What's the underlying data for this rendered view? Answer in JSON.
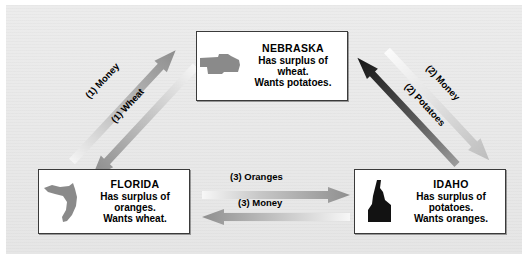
{
  "diagram": {
    "background_color": "#ececec",
    "panel_border_color": "#ffffff"
  },
  "states": [
    {
      "id": "nebraska",
      "name": "NEBRASKA",
      "surplus_line": "Has surplus of",
      "surplus_item": "wheat.",
      "wants_line": "Wants potatoes.",
      "shape_icon": "nebraska-map-icon",
      "shape_color": "#8a8a8a"
    },
    {
      "id": "florida",
      "name": "FLORIDA",
      "surplus_line": "Has surplus of",
      "surplus_item": "oranges.",
      "wants_line": "Wants wheat.",
      "shape_icon": "florida-map-icon",
      "shape_color": "#8a8a8a"
    },
    {
      "id": "idaho",
      "name": "IDAHO",
      "surplus_line": "Has surplus of",
      "surplus_item": "potatoes.",
      "wants_line": "Wants oranges.",
      "shape_icon": "idaho-map-icon",
      "shape_color": "#121212"
    }
  ],
  "flows": [
    {
      "id": "money1",
      "label": "(1) Money",
      "from": "FLORIDA",
      "to": "NEBRASKA",
      "direction": "up-right",
      "style": "gray-gradient"
    },
    {
      "id": "wheat1",
      "label": "(1) Wheat",
      "from": "NEBRASKA",
      "to": "FLORIDA",
      "direction": "down-left",
      "style": "gray-gradient"
    },
    {
      "id": "money2",
      "label": "(2) Money",
      "from": "NEBRASKA",
      "to": "IDAHO",
      "direction": "down-right",
      "style": "light-gradient"
    },
    {
      "id": "potatoes2",
      "label": "(2) Potatoes",
      "from": "IDAHO",
      "to": "NEBRASKA",
      "direction": "up-left",
      "style": "dark-gradient"
    },
    {
      "id": "oranges3",
      "label": "(3) Oranges",
      "from": "FLORIDA",
      "to": "IDAHO",
      "direction": "right",
      "style": "gray-gradient"
    },
    {
      "id": "money3",
      "label": "(3) Money",
      "from": "IDAHO",
      "to": "FLORIDA",
      "direction": "left",
      "style": "gray-gradient"
    }
  ]
}
